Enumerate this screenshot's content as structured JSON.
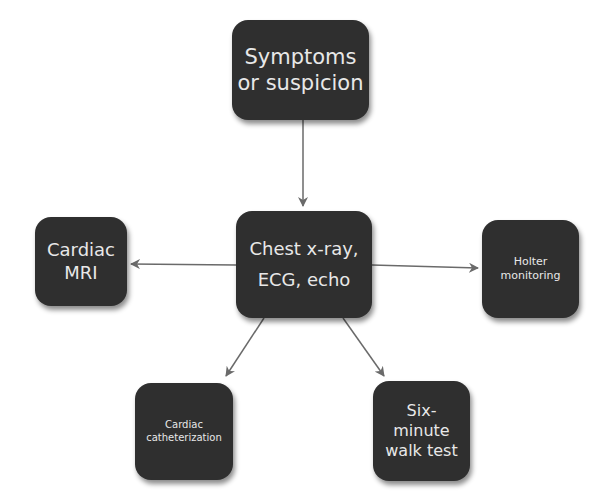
{
  "diagram": {
    "type": "flowchart",
    "colors": {
      "node_fill": "#2f2f2f",
      "node_text": "#e8e8e8",
      "edge": "#6a6a6a",
      "background": "#ffffff"
    },
    "nodes": {
      "top": {
        "id": "symptoms",
        "lines": [
          "Symptoms",
          "or suspicion"
        ]
      },
      "center": {
        "id": "initial-tests",
        "lines": [
          "Chest x-ray,",
          "ECG, echo"
        ]
      },
      "left": {
        "id": "cardiac-mri",
        "lines": [
          "Cardiac",
          "MRI"
        ]
      },
      "right": {
        "id": "holter",
        "lines": [
          "Holter",
          "monitoring"
        ]
      },
      "bottom_left": {
        "id": "catheterization",
        "lines": [
          "Cardiac",
          "catheterization"
        ]
      },
      "bottom_right": {
        "id": "six-minute-walk",
        "lines": [
          "Six-",
          "minute",
          "walk test"
        ]
      }
    },
    "edges": [
      {
        "from": "symptoms",
        "to": "initial-tests"
      },
      {
        "from": "initial-tests",
        "to": "cardiac-mri"
      },
      {
        "from": "initial-tests",
        "to": "holter"
      },
      {
        "from": "initial-tests",
        "to": "catheterization"
      },
      {
        "from": "initial-tests",
        "to": "six-minute-walk"
      }
    ]
  }
}
